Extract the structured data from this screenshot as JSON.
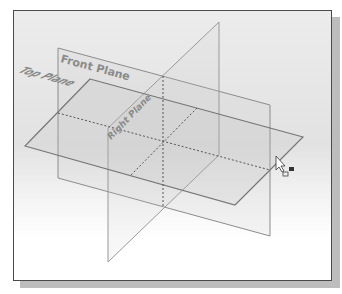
{
  "viewport": {
    "planes": [
      {
        "name": "Front Plane",
        "label": "Front Plane"
      },
      {
        "name": "Top Plane",
        "label": "Top Plane"
      },
      {
        "name": "Right Plane",
        "label": "Right Plane"
      }
    ]
  },
  "cursor": {
    "icon": "select-plane-cursor-icon"
  },
  "colors": {
    "plane_edge": "#8c8c8c",
    "plane_edge_dark": "#6e6e6e",
    "intersection_dash": "#555555",
    "frame_border": "#4a4a4a",
    "shadow": "#bdbdbd"
  }
}
